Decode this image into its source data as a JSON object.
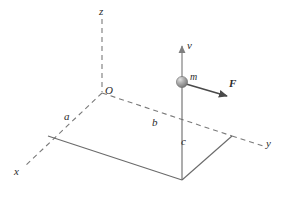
{
  "figure": {
    "background_color": "#ffffff",
    "line_color": "#5a5a5a",
    "dashed_color": "#7a7a7a",
    "text_color": "#2b2b2b",
    "ball_color": "#8d8d8d",
    "ball_highlight_color": "#d8d8d8"
  },
  "axes": {
    "z": {
      "label": "z",
      "x": 99,
      "y": 6
    },
    "x": {
      "label": "x",
      "x": 14,
      "y": 166
    },
    "y": {
      "label": "y",
      "x": 266,
      "y": 138
    }
  },
  "origin": {
    "label": "O",
    "x": 105,
    "y": 85
  },
  "segments": {
    "a": {
      "label": "a",
      "x": 64,
      "y": 111
    },
    "b": {
      "label": "b",
      "x": 152,
      "y": 117
    },
    "c": {
      "label": "c",
      "x": 181,
      "y": 136
    }
  },
  "particle": {
    "mass_label": "m",
    "mass_label_x": 190,
    "mass_label_y": 72,
    "center_x": 182,
    "center_y": 82,
    "radius": 5.5
  },
  "vectors": {
    "velocity": {
      "label": "v",
      "x": 187,
      "y": 40
    },
    "force": {
      "label": "F",
      "x": 229,
      "y": 78
    }
  }
}
